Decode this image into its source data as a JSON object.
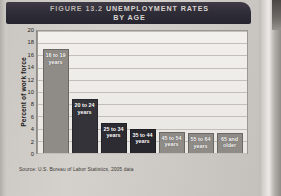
{
  "banner": {
    "figure_label": "FIGURE 13.2",
    "title_line1": "UNEMPLOYMENT RATES",
    "title_line2": "BY AGE"
  },
  "source": "Source: U.S. Bureau of Labor Statistics, 2005 data",
  "chart_data": {
    "type": "bar",
    "title": "Unemployment Rates by Age",
    "xlabel": "",
    "ylabel": "Percent of work force",
    "ylim": [
      0,
      20
    ],
    "ytick_step": 2,
    "yticks": [
      "20",
      "18",
      "16",
      "14",
      "12",
      "10",
      "8",
      "6",
      "4",
      "2",
      "0"
    ],
    "grid": true,
    "legend": "none",
    "categories": [
      "16 to 19\nyears",
      "20 to 24\nyears",
      "25 to 34\nyears",
      "35 to 44\nyears",
      "45 to 54\nyears",
      "55 to 64\nyears",
      "65 and\nolder"
    ],
    "values": [
      17.0,
      8.8,
      5.0,
      3.9,
      3.4,
      3.2,
      3.3
    ],
    "bar_colors": [
      "#8f8b86",
      "#35333a",
      "#2e2c33",
      "#29272e",
      "#8f8b86",
      "#8f8b86",
      "#8f8b86"
    ]
  }
}
